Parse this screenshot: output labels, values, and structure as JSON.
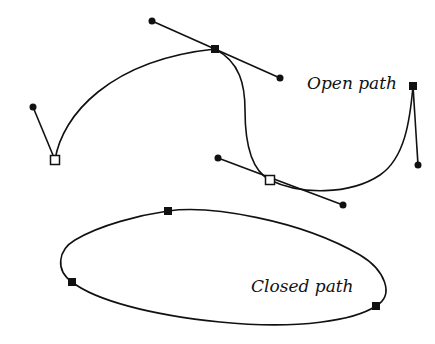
{
  "labels": {
    "open_path": "Open path",
    "closed_path": "Closed path"
  },
  "colors": {
    "stroke": "#111111",
    "background": "#ffffff"
  },
  "open_path": {
    "anchors": [
      {
        "x": 55,
        "y": 160,
        "selected": false
      },
      {
        "x": 215,
        "y": 49,
        "selected": true
      },
      {
        "x": 270,
        "y": 180,
        "selected": false
      },
      {
        "x": 413,
        "y": 86,
        "selected": true
      }
    ],
    "handles": [
      {
        "x": 33,
        "y": 107
      },
      {
        "x": 152,
        "y": 21
      },
      {
        "x": 280,
        "y": 78
      },
      {
        "x": 218,
        "y": 158
      },
      {
        "x": 343,
        "y": 205
      },
      {
        "x": 418,
        "y": 165
      }
    ]
  },
  "closed_path": {
    "anchors": [
      {
        "x": 168,
        "y": 211
      },
      {
        "x": 72,
        "y": 282
      },
      {
        "x": 376,
        "y": 306
      }
    ]
  }
}
